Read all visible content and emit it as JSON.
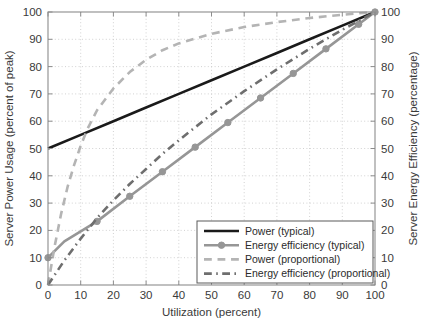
{
  "chart_data": {
    "type": "line",
    "title": "",
    "xlabel": "Utilization (percent)",
    "ylabel": "Server Power Usage (percent of peak)",
    "y2label": "Server Energy Efficiency (percentage)",
    "xlim": [
      0,
      100
    ],
    "ylim": [
      0,
      100
    ],
    "y2lim": [
      0,
      100
    ],
    "xticks": [
      0,
      10,
      20,
      30,
      40,
      50,
      60,
      70,
      80,
      90,
      100
    ],
    "yticks": [
      0,
      10,
      20,
      30,
      40,
      50,
      60,
      70,
      80,
      90,
      100
    ],
    "y2ticks": [
      0,
      10,
      20,
      30,
      40,
      50,
      60,
      70,
      80,
      90,
      100
    ],
    "xticklabels": [
      "0",
      "10",
      "20",
      "30",
      "40",
      "50",
      "60",
      "70",
      "80",
      "90",
      "100"
    ],
    "yticklabels": [
      "0",
      "10",
      "20",
      "30",
      "40",
      "50",
      "60",
      "70",
      "80",
      "90",
      "100"
    ],
    "y2ticklabels": [
      "0",
      "10",
      "20",
      "30",
      "40",
      "50",
      "60",
      "70",
      "80",
      "90",
      "100"
    ],
    "grid": true,
    "legend_position": "lower right",
    "series": [
      {
        "name": "Power (typical)",
        "style": "solid",
        "color": "#1a1a1a",
        "width": 2.6,
        "marker": "none",
        "axis": "left",
        "x": [
          0,
          10,
          20,
          30,
          40,
          50,
          60,
          70,
          80,
          90,
          100
        ],
        "values": [
          50,
          55,
          60,
          65,
          70,
          75,
          80,
          85,
          90,
          95,
          100
        ]
      },
      {
        "name": "Energy efficiency (typical)",
        "style": "solid",
        "color": "#969696",
        "width": 2.6,
        "marker": "circle",
        "axis": "right",
        "x": [
          0,
          5,
          15,
          25,
          35,
          45,
          55,
          65,
          75,
          85,
          95,
          100
        ],
        "values": [
          10,
          16,
          23.3,
          32.5,
          41.5,
          50.5,
          59.5,
          68.5,
          77.5,
          86.5,
          95.5,
          100
        ],
        "marker_x": [
          0,
          15,
          25,
          35,
          45,
          55,
          65,
          75,
          85,
          95,
          100
        ],
        "marker_y": [
          10,
          23.3,
          32.5,
          41.5,
          50.5,
          59.5,
          68.5,
          77.5,
          86.5,
          95.5,
          100
        ]
      },
      {
        "name": "Power (proportional)",
        "style": "dashed",
        "color": "#b4b4b4",
        "width": 2.6,
        "marker": "none",
        "axis": "left",
        "x": [
          0,
          2,
          4,
          6,
          8,
          10,
          12,
          15,
          20,
          25,
          30,
          35,
          40,
          50,
          60,
          70,
          80,
          90,
          100
        ],
        "values": [
          0,
          14,
          26,
          36,
          44,
          51,
          57,
          64,
          72,
          78,
          82.5,
          86,
          88.5,
          92,
          94.5,
          96.3,
          97.8,
          99,
          100
        ]
      },
      {
        "name": "Energy efficiency (proportional)",
        "style": "dashdot",
        "color": "#6e6e6e",
        "width": 2.6,
        "marker": "none",
        "axis": "right",
        "x": [
          0,
          5,
          10,
          15,
          20,
          25,
          30,
          35,
          40,
          50,
          60,
          70,
          80,
          90,
          100
        ],
        "values": [
          0,
          9,
          17,
          24.5,
          31,
          37,
          42.5,
          48,
          53,
          62.5,
          71,
          79,
          86.5,
          93.5,
          100
        ]
      }
    ]
  },
  "legend": {
    "items": [
      {
        "label": "Power (typical)"
      },
      {
        "label": "Energy efficiency (typical)"
      },
      {
        "label": "Power (proportional)"
      },
      {
        "label": "Energy efficiency (proportional)"
      }
    ]
  }
}
